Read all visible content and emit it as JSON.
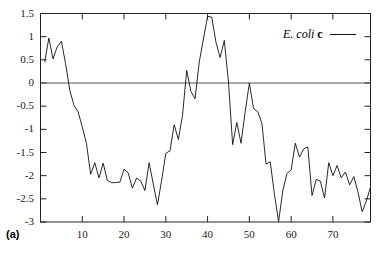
{
  "panel": {
    "label": "(a)"
  },
  "legend": {
    "species": "E. coli",
    "strand": "c",
    "sample_line": ""
  },
  "chart_data": {
    "type": "line",
    "title": "",
    "subtitle": "",
    "xlabel": "",
    "ylabel": "",
    "xlim": [
      0,
      79
    ],
    "ylim": [
      -3,
      1.5
    ],
    "xticks": [
      10,
      20,
      30,
      40,
      50,
      60,
      70
    ],
    "yticks": [
      1.5,
      1,
      0.5,
      0,
      -0.5,
      -1,
      -1.5,
      -2,
      -2.5,
      -3
    ],
    "ytick_labels": [
      "1.5",
      "1",
      "0.5",
      "0",
      "-0.5",
      "-1",
      "-1.5",
      "-2",
      "-2.5",
      "-3"
    ],
    "xtick_labels": [
      "10",
      "20",
      "30",
      "40",
      "50",
      "60",
      "70"
    ],
    "grid": false,
    "zero_line": 0,
    "legend_position": "top-right",
    "line_color": "#111111",
    "series": [
      {
        "name": "E. coli c",
        "x": [
          1,
          2,
          3,
          4,
          5,
          6,
          7,
          8,
          9,
          10,
          11,
          12,
          13,
          14,
          15,
          16,
          17,
          18,
          19,
          20,
          21,
          22,
          23,
          24,
          25,
          26,
          27,
          28,
          29,
          30,
          31,
          32,
          33,
          34,
          35,
          36,
          37,
          38,
          39,
          40,
          41,
          42,
          43,
          44,
          45,
          46,
          47,
          48,
          49,
          50,
          51,
          52,
          53,
          54,
          55,
          56,
          57,
          58,
          59,
          60,
          61,
          62,
          63,
          64,
          65,
          66,
          67,
          68,
          69,
          70,
          71,
          72,
          73,
          74,
          75,
          76,
          77,
          78,
          79
        ],
        "values": [
          0.45,
          0.97,
          0.52,
          0.78,
          0.9,
          0.42,
          -0.15,
          -0.48,
          -0.62,
          -0.95,
          -1.3,
          -1.97,
          -1.72,
          -2.05,
          -1.73,
          -2.1,
          -2.15,
          -2.15,
          -2.14,
          -1.86,
          -1.94,
          -2.27,
          -2.05,
          -2.12,
          -2.32,
          -1.72,
          -2.18,
          -2.63,
          -2.1,
          -1.52,
          -1.46,
          -0.9,
          -1.22,
          -0.7,
          0.27,
          -0.18,
          -0.34,
          0.45,
          0.95,
          1.44,
          1.42,
          0.88,
          0.55,
          0.92,
          0.02,
          -1.33,
          -0.85,
          -1.3,
          -0.62,
          0.0,
          -0.55,
          -0.62,
          -0.87,
          -1.75,
          -1.7,
          -2.4,
          -2.99,
          -2.33,
          -1.95,
          -1.88,
          -1.3,
          -1.6,
          -1.42,
          -1.38,
          -2.43,
          -2.08,
          -2.12,
          -2.48,
          -1.72,
          -2.0,
          -1.78,
          -2.05,
          -1.92,
          -2.2,
          -2.02,
          -2.35,
          -2.78,
          -2.55,
          -2.25
        ]
      }
    ]
  }
}
